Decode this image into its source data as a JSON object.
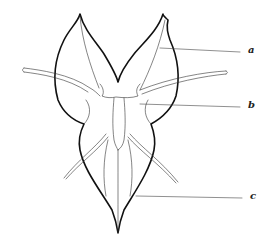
{
  "figure": {
    "labels": [
      {
        "id": "a",
        "text": "a"
      },
      {
        "id": "b",
        "text": "b"
      },
      {
        "id": "c",
        "text": "c"
      }
    ]
  }
}
